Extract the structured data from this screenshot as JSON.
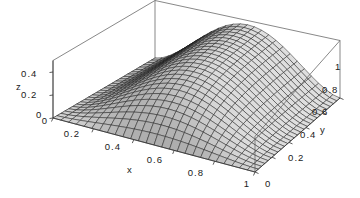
{
  "figure": {
    "kind": "surface-plot-3d",
    "background_color": "#ffffff",
    "box_line_color": "#555555",
    "mesh_line_color": "#1c1c1c",
    "surface_fill_light": "#d8d8d8",
    "surface_fill_dark": "#8c8c8c"
  },
  "axes": {
    "x": {
      "label": "x",
      "ticks": [
        "0",
        "0.2",
        "0.4",
        "0.6",
        "0.8",
        "1"
      ],
      "tick_values": [
        0,
        0.2,
        0.4,
        0.6,
        0.8,
        1
      ],
      "range": [
        0,
        1
      ]
    },
    "y": {
      "label": "y",
      "ticks": [
        "0",
        "0.2",
        "0.4",
        "0.6",
        "0.8",
        "1"
      ],
      "tick_values": [
        0,
        0.2,
        0.4,
        0.6,
        0.8,
        1
      ],
      "range": [
        0,
        1
      ]
    },
    "z": {
      "label": "z",
      "ticks": [
        "0",
        "0.2",
        "0.4"
      ],
      "tick_values": [
        0,
        0.2,
        0.4
      ],
      "range": [
        0,
        0.5
      ]
    }
  },
  "chart_data": {
    "type": "surface",
    "title": "",
    "xlabel": "x",
    "ylabel": "y",
    "zlabel": "z",
    "xlim": [
      0,
      1
    ],
    "ylim": [
      0,
      1
    ],
    "zlim": [
      0,
      0.5
    ],
    "xticks": [
      0,
      0.2,
      0.4,
      0.6,
      0.8,
      1
    ],
    "yticks": [
      0,
      0.2,
      0.4,
      0.6,
      0.8,
      1
    ],
    "zticks": [
      0,
      0.2,
      0.4
    ],
    "grid": true,
    "legend": "none",
    "mesh_divisions_x": 26,
    "mesh_divisions_y": 26,
    "surface_model": {
      "form": "z = A * sin(pi*x)^p * (1 - exp(-k*y))",
      "A": 0.47,
      "p": 1.6,
      "k": 4.2
    },
    "sample_grid": {
      "x": [
        0,
        0.2,
        0.4,
        0.6,
        0.8,
        1
      ],
      "y": [
        0,
        0.2,
        0.4,
        0.6,
        0.8,
        1
      ],
      "z_rows": [
        [
          0,
          0,
          0,
          0,
          0,
          0
        ],
        [
          0,
          0.16,
          0.21,
          0.23,
          0.24,
          0.24
        ],
        [
          0,
          0.25,
          0.33,
          0.36,
          0.37,
          0.37
        ],
        [
          0,
          0.28,
          0.38,
          0.42,
          0.43,
          0.43
        ],
        [
          0,
          0.24,
          0.33,
          0.36,
          0.37,
          0.37
        ],
        [
          0,
          0.0,
          0.0,
          0.0,
          0.0,
          0.0
        ]
      ],
      "row_variable": "x",
      "column_variable": "y"
    }
  },
  "tick_labels": {
    "x": [
      {
        "text": "0",
        "x": 45,
        "y": 124
      },
      {
        "text": "0.2",
        "x": 72,
        "y": 137
      },
      {
        "text": "0.4",
        "x": 113,
        "y": 150
      },
      {
        "text": "0.6",
        "x": 155,
        "y": 163
      },
      {
        "text": "0.8",
        "x": 196,
        "y": 176
      },
      {
        "text": "1",
        "x": 247,
        "y": 187
      }
    ],
    "y": [
      {
        "text": "0",
        "x": 265,
        "y": 187
      },
      {
        "text": "0.2",
        "x": 288,
        "y": 161
      },
      {
        "text": "0.4",
        "x": 300,
        "y": 138
      },
      {
        "text": "0.6",
        "x": 312,
        "y": 115
      },
      {
        "text": "0.8",
        "x": 322,
        "y": 93
      },
      {
        "text": "1",
        "x": 335,
        "y": 70
      }
    ],
    "z": [
      {
        "text": "0",
        "x": 36,
        "y": 118
      },
      {
        "text": "0.2",
        "x": 21,
        "y": 98
      },
      {
        "text": "0.4",
        "x": 21,
        "y": 77
      }
    ]
  },
  "axis_titles": {
    "x": {
      "text": "x",
      "x": 127,
      "y": 173
    },
    "y": {
      "text": "y",
      "x": 320,
      "y": 133
    },
    "z": {
      "text": "z",
      "x": 16,
      "y": 90
    }
  }
}
